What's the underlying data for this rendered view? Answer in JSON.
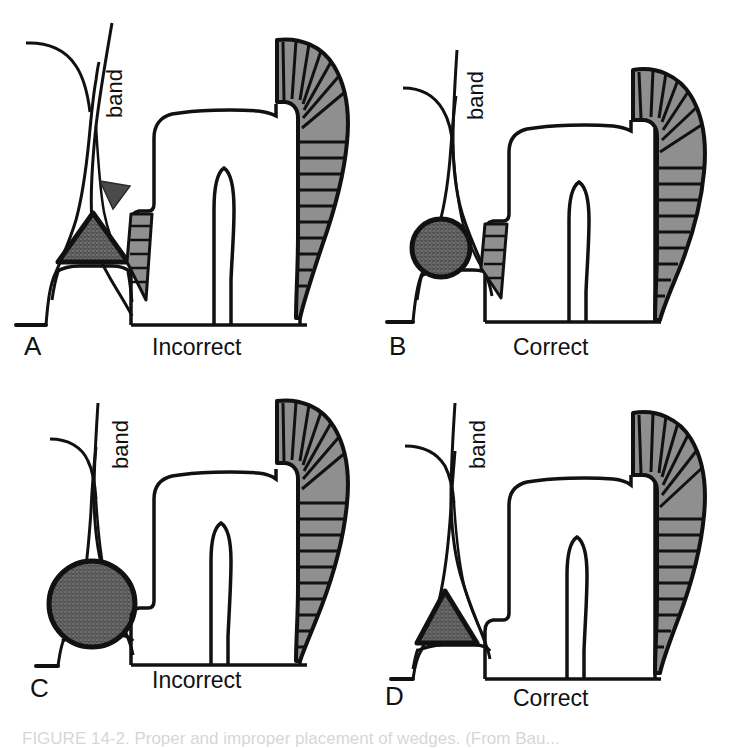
{
  "figure": {
    "background_color": "#ffffff",
    "line_color": "#111111",
    "shade_fill": "#8f8f8f",
    "stipple_fill": "#6b6b6b",
    "panel_count": 4,
    "bottom_caption": "FIGURE 14-2. Proper and improper placement of wedges. (From Bau..."
  },
  "panels": [
    {
      "id": "A",
      "letter": "A",
      "caption": "Incorrect",
      "band_label": "band",
      "wedge_shape": "triangle",
      "wedge_size": "small",
      "wedge_position": "high",
      "has_arrowhead": true,
      "arrow_note": "arrowhead indicating overhang / gap at gingival margin"
    },
    {
      "id": "B",
      "letter": "B",
      "caption": "Correct",
      "band_label": "band",
      "wedge_shape": "circle",
      "wedge_size": "small",
      "wedge_position": "high",
      "has_arrowhead": false,
      "arrow_note": ""
    },
    {
      "id": "C",
      "letter": "C",
      "caption": "Incorrect",
      "band_label": "band",
      "wedge_shape": "circle",
      "wedge_size": "large",
      "wedge_position": "low",
      "has_arrowhead": false,
      "arrow_note": ""
    },
    {
      "id": "D",
      "letter": "D",
      "caption": "Correct",
      "band_label": "band",
      "wedge_shape": "triangle",
      "wedge_size": "large",
      "wedge_position": "low",
      "has_arrowhead": false,
      "arrow_note": ""
    }
  ]
}
